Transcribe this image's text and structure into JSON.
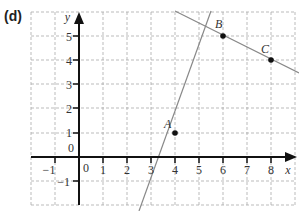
{
  "figure_label": "(d)",
  "axes": {
    "x_label": "x",
    "y_label": "y",
    "x_ticks": [
      "−1",
      "0",
      "1",
      "2",
      "3",
      "4",
      "5",
      "6",
      "7",
      "8"
    ],
    "y_ticks": [
      "−1",
      "0",
      "1",
      "2",
      "3",
      "4",
      "5"
    ]
  },
  "points": [
    {
      "name": "A",
      "x": 4,
      "y": 1
    },
    {
      "name": "B",
      "x": 6,
      "y": 5
    },
    {
      "name": "C",
      "x": 8,
      "y": 4
    }
  ],
  "lines": [
    {
      "through": [
        "A",
        "B"
      ],
      "slope": 2
    },
    {
      "through": [
        "B",
        "C"
      ],
      "slope": -0.5
    }
  ],
  "colors": {
    "grid": "#aaaaaa",
    "axis": "#111111",
    "line": "#888888",
    "point": "#111111"
  }
}
